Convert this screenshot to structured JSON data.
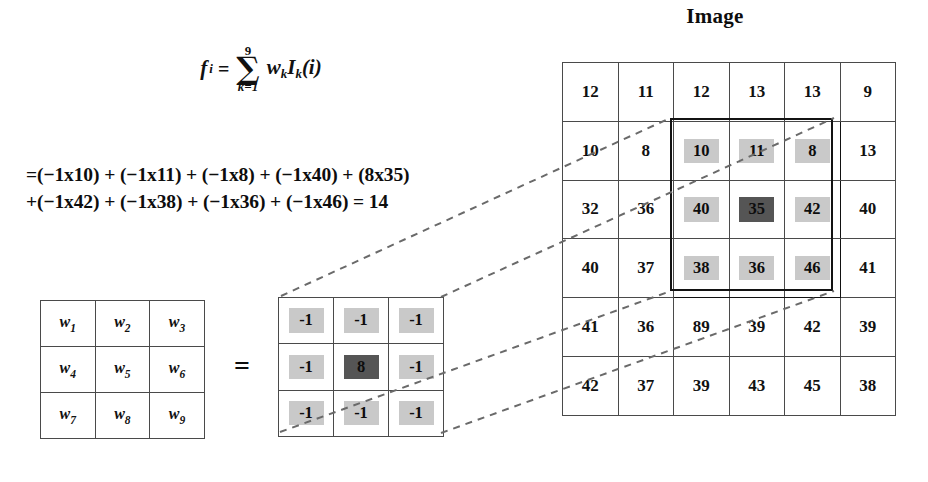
{
  "title": {
    "image_label": "Image"
  },
  "formula": {
    "lhs_var": "f",
    "lhs_sub": "i",
    "equals": "=",
    "sigma_upper": "9",
    "sigma_glyph": "∑",
    "sigma_lower": "k=1",
    "summand": "w",
    "summand_sub_1": "k",
    "summand_2": "I",
    "summand_sub_2": "k",
    "summand_arg": "(i)",
    "line_1": "=(−1x10) + (−1x11) + (−1x8) + (−1x40) + (8x35)",
    "line_2": "+(−1x42) + (−1x38) + (−1x36) + (−1x46) = 14",
    "result": "14"
  },
  "weight_matrix": {
    "symbol": "w",
    "rows": [
      [
        {
          "base": "w",
          "sub": "1"
        },
        {
          "base": "w",
          "sub": "2"
        },
        {
          "base": "w",
          "sub": "3"
        }
      ],
      [
        {
          "base": "w",
          "sub": "4"
        },
        {
          "base": "w",
          "sub": "5"
        },
        {
          "base": "w",
          "sub": "6"
        }
      ],
      [
        {
          "base": "w",
          "sub": "7"
        },
        {
          "base": "w",
          "sub": "8"
        },
        {
          "base": "w",
          "sub": "9"
        }
      ]
    ]
  },
  "matrix_equals": "=",
  "kernel_matrix": {
    "rows": [
      [
        {
          "value": "-1",
          "style": "light"
        },
        {
          "value": "-1",
          "style": "light"
        },
        {
          "value": "-1",
          "style": "light"
        }
      ],
      [
        {
          "value": "-1",
          "style": "light"
        },
        {
          "value": "8",
          "style": "dark"
        },
        {
          "value": "-1",
          "style": "light"
        }
      ],
      [
        {
          "value": "-1",
          "style": "light"
        },
        {
          "value": "-1",
          "style": "light"
        },
        {
          "value": "-1",
          "style": "light"
        }
      ]
    ]
  },
  "image_grid": {
    "rows": [
      [
        {
          "value": "12"
        },
        {
          "value": "11"
        },
        {
          "value": "12"
        },
        {
          "value": "13"
        },
        {
          "value": "13"
        },
        {
          "value": "9"
        }
      ],
      [
        {
          "value": "10"
        },
        {
          "value": "8"
        },
        {
          "value": "10",
          "style": "light"
        },
        {
          "value": "11",
          "style": "light"
        },
        {
          "value": "8",
          "style": "light"
        },
        {
          "value": "13"
        }
      ],
      [
        {
          "value": "32"
        },
        {
          "value": "36"
        },
        {
          "value": "40",
          "style": "light"
        },
        {
          "value": "35",
          "style": "dark"
        },
        {
          "value": "42",
          "style": "light"
        },
        {
          "value": "40"
        }
      ],
      [
        {
          "value": "40"
        },
        {
          "value": "37"
        },
        {
          "value": "38",
          "style": "light"
        },
        {
          "value": "36",
          "style": "light"
        },
        {
          "value": "46",
          "style": "light"
        },
        {
          "value": "41"
        }
      ],
      [
        {
          "value": "41"
        },
        {
          "value": "36"
        },
        {
          "value": "89"
        },
        {
          "value": "39"
        },
        {
          "value": "42"
        },
        {
          "value": "39"
        }
      ],
      [
        {
          "value": "42"
        },
        {
          "value": "37"
        },
        {
          "value": "39"
        },
        {
          "value": "43"
        },
        {
          "value": "45"
        },
        {
          "value": "38"
        }
      ]
    ],
    "selection": {
      "col_start": 3,
      "col_end": 5,
      "row_start": 2,
      "row_end": 4
    }
  },
  "colors": {
    "highlight_light": "#c9c9c9",
    "highlight_dark": "#555555",
    "grid_line": "#4a4a4a",
    "selection_border": "#131313",
    "dashed_line": "#6a6a6a",
    "text": "#0d0d0d"
  }
}
